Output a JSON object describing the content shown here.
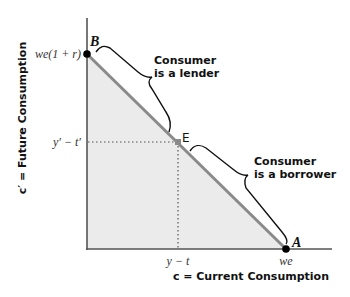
{
  "diagram": {
    "type": "budget-constraint",
    "y_axis_title": "c′ = Future Consumption",
    "x_axis_title": "c = Current Consumption",
    "y_tick_labels": {
      "intercept": "we(1 + r)",
      "endowment": "y′ − t′"
    },
    "x_tick_labels": {
      "endowment": "y − t",
      "intercept": "we"
    },
    "points": {
      "B": "B",
      "E": "E",
      "A": "A"
    },
    "annotations": {
      "lender_line1": "Consumer",
      "lender_line2": "is a lender",
      "borrower_line1": "Consumer",
      "borrower_line2": "is a borrower"
    },
    "colors": {
      "budget_line": "#8a8a8a",
      "feasible_region": "#ebebeb",
      "axis": "#555555",
      "endowment_point": "#8a8a8a",
      "intercept_points": "#000000"
    }
  }
}
